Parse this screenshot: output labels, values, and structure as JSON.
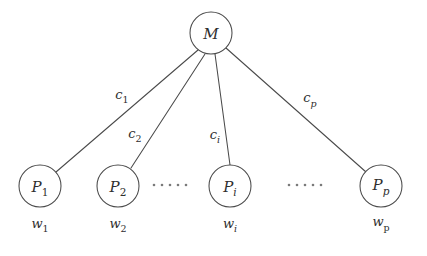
{
  "diagram": {
    "type": "node-link-diagram",
    "colors": {
      "stroke": "#4a4a4a",
      "text": "#2e2e2e",
      "background": "#ffffff",
      "dots": "#7a7a7a"
    },
    "root_node": {
      "id": "M",
      "label": "M",
      "cx": 211,
      "cy": 33,
      "r": 21
    },
    "leaf_nodes": [
      {
        "id": "P1",
        "label": "P",
        "subscript": "1",
        "subscript_style": "normal",
        "cx": 40,
        "cy": 186,
        "r": 21,
        "weight_label": "w",
        "weight_subscript": "1",
        "weight_subscript_style": "normal"
      },
      {
        "id": "P2",
        "label": "P",
        "subscript": "2",
        "subscript_style": "normal",
        "cx": 118,
        "cy": 186,
        "r": 21,
        "weight_label": "w",
        "weight_subscript": "2",
        "weight_subscript_style": "normal"
      },
      {
        "id": "Pi",
        "label": "P",
        "subscript": "i",
        "subscript_style": "italic",
        "cx": 230,
        "cy": 186,
        "r": 21,
        "weight_label": "w",
        "weight_subscript": "i",
        "weight_subscript_style": "italic"
      },
      {
        "id": "Pp",
        "label": "P",
        "subscript": "p",
        "subscript_style": "italic",
        "cx": 381,
        "cy": 186,
        "r": 21,
        "weight_label": "w",
        "weight_subscript": "p",
        "weight_subscript_style": "upright"
      }
    ],
    "edges": [
      {
        "id": "edge-M-P1",
        "from": "M",
        "to": "P1",
        "x1": 198,
        "y1": 50,
        "x2": 56,
        "y2": 172,
        "label": "c",
        "subscript": "1",
        "label_x": 122,
        "label_y": 99
      },
      {
        "id": "edge-M-P2",
        "from": "M",
        "to": "P2",
        "x1": 205,
        "y1": 54,
        "x2": 131,
        "y2": 168,
        "label": "c",
        "subscript": "2",
        "label_x": 135,
        "label_y": 138
      },
      {
        "id": "edge-M-Pi",
        "from": "M",
        "to": "Pi",
        "x1": 215,
        "y1": 54,
        "x2": 230,
        "y2": 165,
        "label": "c",
        "subscript": "i",
        "label_x": 215,
        "label_y": 139
      },
      {
        "id": "edge-M-Pp",
        "from": "M",
        "to": "Pp",
        "x1": 226,
        "y1": 48,
        "x2": 366,
        "y2": 172,
        "label": "c",
        "subscript": "p",
        "label_x": 310,
        "label_y": 104
      }
    ],
    "ellipses": [
      {
        "id": "ellipsis-between-P2-Pi",
        "cx": 170,
        "cy": 185,
        "dot_count": 5,
        "spacing": 8
      },
      {
        "id": "ellipsis-between-Pi-Pp",
        "cx": 305,
        "cy": 185,
        "dot_count": 5,
        "spacing": 8
      }
    ]
  }
}
